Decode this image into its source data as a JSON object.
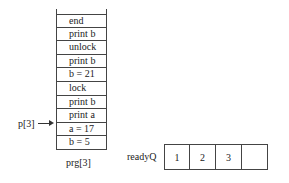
{
  "program": {
    "label": "prg[3]",
    "instructions": [
      "end",
      "print b",
      "unlock",
      "print b",
      "b = 21",
      "lock",
      "print b",
      "print a",
      "a = 17",
      "b = 5"
    ]
  },
  "pointer": {
    "label": "p[3]",
    "target_index": 7
  },
  "ready_queue": {
    "label": "readyQ",
    "slots": [
      "1",
      "2",
      "3",
      ""
    ]
  }
}
